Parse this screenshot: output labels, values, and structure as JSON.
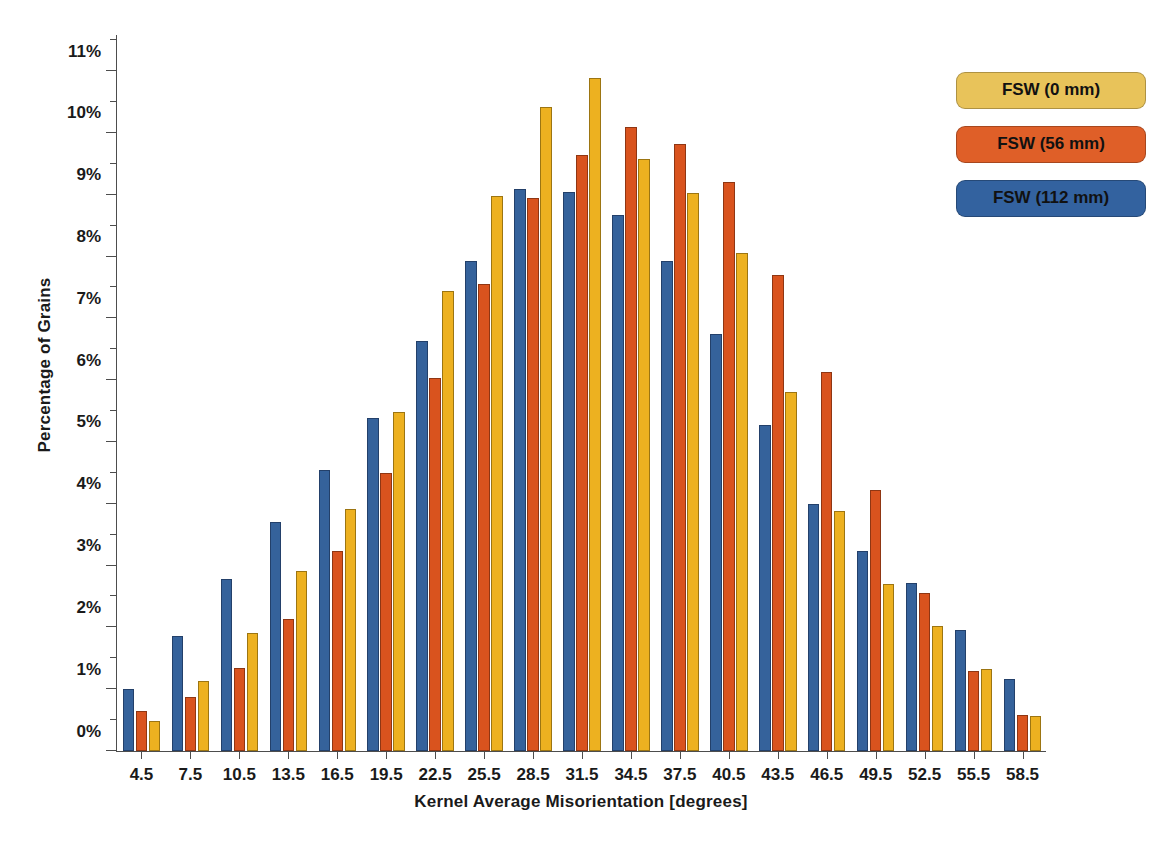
{
  "chart_data": {
    "type": "bar",
    "title": "",
    "xlabel": "Kernel Average Misorientation [degrees]",
    "ylabel": "Percentage of Grains",
    "grid": false,
    "legend_position": "top-right",
    "ylim": [
      0,
      11.6
    ],
    "ytick_values": [
      0,
      1,
      2,
      3,
      4,
      5,
      6,
      7,
      8,
      9,
      10,
      11
    ],
    "ytick_labels": [
      "0%",
      "1%",
      "2%",
      "3%",
      "4%",
      "5%",
      "6%",
      "7%",
      "8%",
      "9%",
      "10%",
      "11%"
    ],
    "categories": [
      "4.5",
      "7.5",
      "10.5",
      "13.5",
      "16.5",
      "19.5",
      "22.5",
      "25.5",
      "28.5",
      "31.5",
      "34.5",
      "37.5",
      "40.5",
      "43.5",
      "46.5",
      "49.5",
      "52.5",
      "55.5",
      "58.5"
    ],
    "series": [
      {
        "name": "FSW (0 mm)",
        "color": "#edb120",
        "values": [
          0.48,
          1.13,
          1.91,
          2.92,
          3.92,
          5.48,
          7.45,
          8.98,
          10.42,
          10.89,
          9.58,
          9.02,
          8.05,
          5.81,
          3.89,
          2.71,
          2.02,
          1.32,
          0.57
        ]
      },
      {
        "name": "FSW (56 mm)",
        "color": "#d9531e",
        "values": [
          0.64,
          0.88,
          1.35,
          2.14,
          3.24,
          4.49,
          6.04,
          7.56,
          8.95,
          9.65,
          10.1,
          9.82,
          9.21,
          7.7,
          6.13,
          4.23,
          2.55,
          1.29,
          0.58
        ]
      },
      {
        "name": "FSW (112 mm)",
        "color": "#35629b",
        "values": [
          1.0,
          1.86,
          2.79,
          3.7,
          4.54,
          5.39,
          6.64,
          7.93,
          9.1,
          9.04,
          8.67,
          7.93,
          6.75,
          5.28,
          4.0,
          3.23,
          2.72,
          1.96,
          1.17
        ]
      }
    ],
    "series_draw_order": [
      "FSW (112 mm)",
      "FSW (56 mm)",
      "FSW (0 mm)"
    ]
  },
  "legend": {
    "items": [
      {
        "label": "FSW (0 mm)",
        "color": "#e8c35a"
      },
      {
        "label": "FSW (56 mm)",
        "color": "#df5f28"
      },
      {
        "label": "FSW (112 mm)",
        "color": "#33629f"
      }
    ]
  }
}
